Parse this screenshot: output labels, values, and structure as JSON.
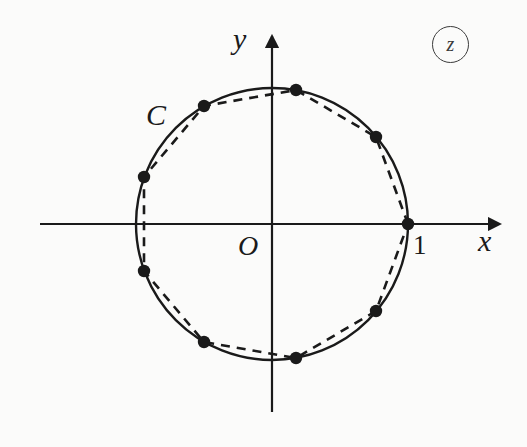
{
  "figure": {
    "background_color": "#fbfbfa",
    "ink_color": "#1a1a1a"
  },
  "plane_tag": {
    "label": "z",
    "shape": "circled",
    "color": "#3b3b3b"
  },
  "axes": {
    "x_label": "x",
    "y_label": "y",
    "origin_label": "O",
    "origin_px": {
      "x": 272,
      "y": 224
    },
    "x_axis": {
      "x_start": 40,
      "x_end": 500,
      "y": 224
    },
    "y_axis": {
      "y_start": 36,
      "y_end": 412,
      "x": 272
    },
    "arrow_heads": [
      "x-positive",
      "y-positive"
    ],
    "color": "#1a1a1a",
    "stroke_width": 2.2
  },
  "tick_labels": [
    {
      "text": "1",
      "value": 1,
      "axis": "x",
      "px": {
        "x": 413,
        "y": 232
      }
    }
  ],
  "curve": {
    "name": "C",
    "label": "C",
    "label_px": {
      "x": 146,
      "y": 100
    },
    "type": "circle",
    "radius_units": 1,
    "center_px": {
      "x": 272,
      "y": 224
    },
    "radius_px": 136,
    "style": "solid",
    "stroke_width": 2.4,
    "color": "#1a1a1a"
  },
  "inscribed_polygon": {
    "type": "regular-polygon",
    "sides": 9,
    "style": "dashed",
    "stroke_width": 2.6,
    "dash_pattern": "9 7",
    "color": "#1a1a1a",
    "description": "nonagon inscribed in C with one vertex at z = 1"
  },
  "chart_data": {
    "type": "scatter",
    "xlabel": "x",
    "ylabel": "y",
    "xlim": [
      -1.7,
      1.7
    ],
    "ylim": [
      -1.45,
      1.45
    ],
    "grid": false,
    "legend": null,
    "annotations": [
      {
        "text": "C",
        "x": -0.93,
        "y": 0.86
      },
      {
        "text": "O",
        "x": -0.24,
        "y": -0.12
      },
      {
        "text": "1",
        "x": 1.04,
        "y": -0.12
      },
      {
        "text": "z",
        "x": 1.18,
        "y": 1.22
      }
    ],
    "series": [
      {
        "name": "circle C",
        "type": "line",
        "style": "solid",
        "closed": true,
        "radius": 1.0
      },
      {
        "name": "inscribed polygon vertices",
        "type": "scatter",
        "marker": "filled-circle",
        "angles_deg": [
          0,
          40,
          80,
          120,
          160,
          200,
          240,
          280,
          320
        ],
        "x": [
          1.0,
          0.766,
          0.174,
          -0.5,
          -0.94,
          -0.94,
          -0.5,
          0.174,
          0.766
        ],
        "y": [
          0.0,
          0.643,
          0.985,
          0.866,
          0.342,
          -0.342,
          -0.866,
          -0.985,
          -0.643
        ]
      },
      {
        "name": "inscribed polygon edges",
        "type": "line",
        "style": "dashed",
        "closed": true
      }
    ]
  },
  "markers": {
    "count": 9,
    "shape": "filled-circle",
    "radius_px": 6.2,
    "color": "#1a1a1a",
    "points_px": [
      {
        "angle_deg": 0,
        "x": 408,
        "y": 224
      },
      {
        "angle_deg": 40,
        "x": 376,
        "y": 137
      },
      {
        "angle_deg": 80,
        "x": 296,
        "y": 90
      },
      {
        "angle_deg": 120,
        "x": 204,
        "y": 106
      },
      {
        "angle_deg": 160,
        "x": 144,
        "y": 177
      },
      {
        "angle_deg": 200,
        "x": 144,
        "y": 271
      },
      {
        "angle_deg": 240,
        "x": 204,
        "y": 342
      },
      {
        "angle_deg": 280,
        "x": 296,
        "y": 358
      },
      {
        "angle_deg": 320,
        "x": 376,
        "y": 311
      }
    ]
  }
}
